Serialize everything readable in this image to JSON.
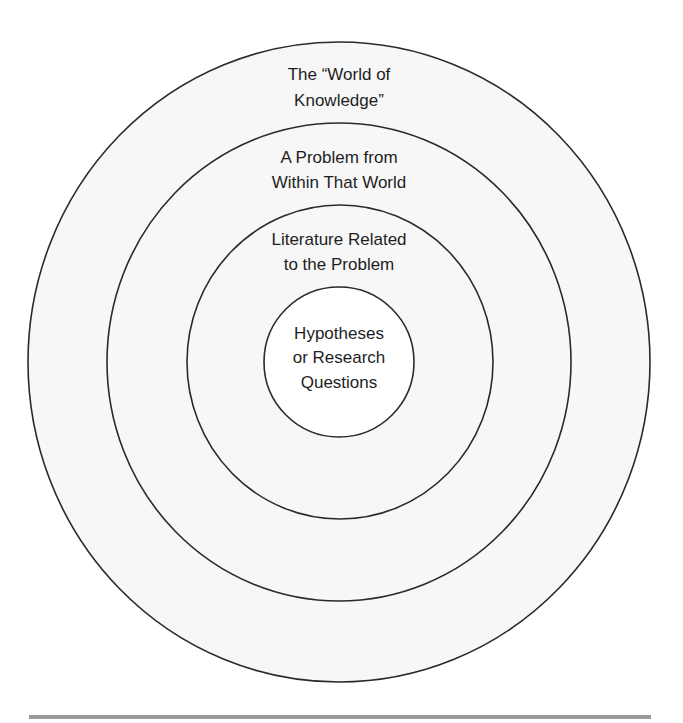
{
  "diagram": {
    "type": "concentric-circles",
    "stroke_color": "#2a2a2a",
    "fill_color": "#f7f7f7",
    "inner_fill_color": "#ffffff",
    "rule_color": "#9a9a9a",
    "rings": [
      {
        "id": "world-of-knowledge",
        "lines": [
          "The “World of",
          "Knowledge”"
        ]
      },
      {
        "id": "problem-within-world",
        "lines": [
          "A Problem from",
          "Within That World"
        ]
      },
      {
        "id": "related-literature",
        "lines": [
          "Literature Related",
          "to the Problem"
        ]
      },
      {
        "id": "hypotheses",
        "lines": [
          "Hypotheses",
          "or Research",
          "Questions"
        ]
      }
    ]
  }
}
